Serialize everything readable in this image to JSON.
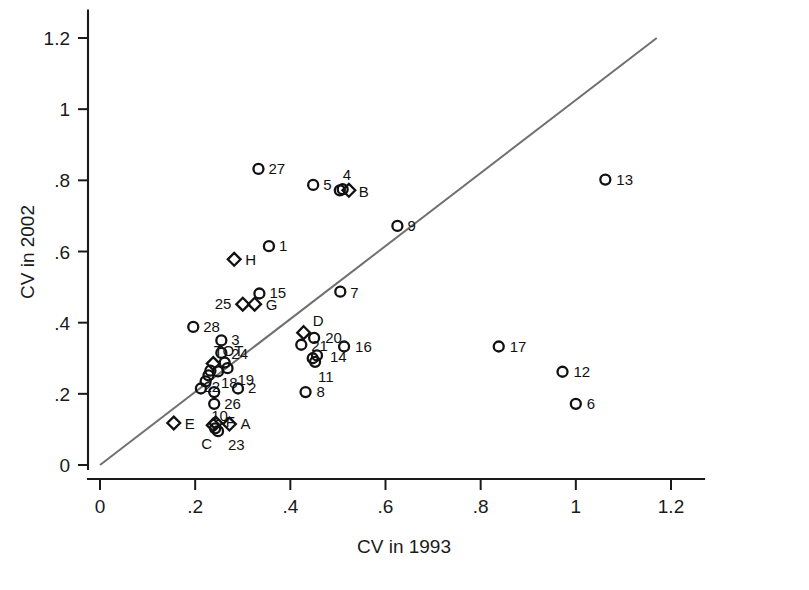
{
  "chart_data": {
    "type": "scatter",
    "title": "",
    "xlabel": "CV in 1993",
    "ylabel": "CV in 2002",
    "xlim": [
      0,
      1.24
    ],
    "ylim": [
      0,
      1.26
    ],
    "xticks": [
      "0",
      ".2",
      ".4",
      ".6",
      ".8",
      "1",
      "1.2"
    ],
    "xtick_values": [
      0,
      0.2,
      0.4,
      0.6,
      0.8,
      1.0,
      1.2
    ],
    "yticks": [
      "0",
      ".2",
      ".4",
      ".6",
      ".8",
      "1",
      "1.2"
    ],
    "ytick_values": [
      0,
      0.2,
      0.4,
      0.6,
      0.8,
      1.0,
      1.2
    ],
    "grid": false,
    "legend": "none",
    "reference_line": {
      "name": "identity-line",
      "from": [
        0.0,
        0.0
      ],
      "to": [
        1.17,
        1.2
      ],
      "color": "#70706e"
    },
    "points": [
      {
        "label": "1",
        "marker": "circle",
        "x": 0.355,
        "y": 0.615,
        "lx": 10,
        "ly": 5
      },
      {
        "label": "2",
        "marker": "circle",
        "x": 0.29,
        "y": 0.215,
        "lx": 10,
        "ly": 5
      },
      {
        "label": "3",
        "marker": "circle",
        "x": 0.255,
        "y": 0.35,
        "lx": 10,
        "ly": 5
      },
      {
        "label": "4",
        "marker": "circle",
        "x": 0.51,
        "y": 0.775,
        "lx": 0,
        "ly": -9
      },
      {
        "label": "5",
        "marker": "circle",
        "x": 0.448,
        "y": 0.787,
        "lx": 10,
        "ly": 5
      },
      {
        "label": "6",
        "marker": "circle",
        "x": 1.0,
        "y": 0.172,
        "lx": 11,
        "ly": 5
      },
      {
        "label": "7",
        "marker": "circle",
        "x": 0.505,
        "y": 0.487,
        "lx": 10,
        "ly": 6
      },
      {
        "label": "8",
        "marker": "circle",
        "x": 0.432,
        "y": 0.205,
        "lx": 11,
        "ly": 5
      },
      {
        "label": "9",
        "marker": "circle",
        "x": 0.625,
        "y": 0.672,
        "lx": 10,
        "ly": 5
      },
      {
        "label": "10",
        "marker": "circle",
        "x": 0.24,
        "y": 0.172,
        "lx": -3,
        "ly": 17
      },
      {
        "label": "11",
        "marker": "circle",
        "x": 0.452,
        "y": 0.29,
        "lx": 3,
        "ly": 20
      },
      {
        "label": "12",
        "marker": "circle",
        "x": 0.972,
        "y": 0.262,
        "lx": 11,
        "ly": 5
      },
      {
        "label": "13",
        "marker": "circle",
        "x": 1.062,
        "y": 0.802,
        "lx": 11,
        "ly": 5
      },
      {
        "label": "14",
        "marker": "circle",
        "x": 0.456,
        "y": 0.308,
        "lx": 13,
        "ly": 7
      },
      {
        "label": "15",
        "marker": "circle",
        "x": 0.335,
        "y": 0.482,
        "lx": 10,
        "ly": 5
      },
      {
        "label": "16",
        "marker": "circle",
        "x": 0.513,
        "y": 0.333,
        "lx": 11,
        "ly": 5
      },
      {
        "label": "17",
        "marker": "circle",
        "x": 0.838,
        "y": 0.333,
        "lx": 11,
        "ly": 5
      },
      {
        "label": "18",
        "marker": "circle",
        "x": 0.248,
        "y": 0.263,
        "lx": 3,
        "ly": 17
      },
      {
        "label": "19",
        "marker": "circle",
        "x": 0.268,
        "y": 0.272,
        "lx": 10,
        "ly": 17
      },
      {
        "label": "20",
        "marker": "circle",
        "x": 0.45,
        "y": 0.357,
        "lx": 11,
        "ly": 5
      },
      {
        "label": "21",
        "marker": "circle",
        "x": 0.423,
        "y": 0.338,
        "lx": 10,
        "ly": 6
      },
      {
        "label": "22",
        "marker": "circle",
        "x": 0.228,
        "y": 0.252,
        "lx": -5,
        "ly": 17
      },
      {
        "label": "23",
        "marker": "circle",
        "x": 0.248,
        "y": 0.095,
        "lx": 10,
        "ly": 19
      },
      {
        "label": "24",
        "marker": "circle",
        "x": 0.255,
        "y": 0.315,
        "lx": 10,
        "ly": 6
      },
      {
        "label": "25",
        "marker": "diamond",
        "x": 0.3,
        "y": 0.452,
        "lx": -28,
        "ly": 5
      },
      {
        "label": "26",
        "marker": "circle",
        "x": 0.24,
        "y": 0.205,
        "lx": 10,
        "ly": 17
      },
      {
        "label": "27",
        "marker": "circle",
        "x": 0.333,
        "y": 0.832,
        "lx": 10,
        "ly": 5
      },
      {
        "label": "28",
        "marker": "circle",
        "x": 0.196,
        "y": 0.388,
        "lx": 10,
        "ly": 5
      },
      {
        "label": "TOT",
        "marker": "circle",
        "x": 0.262,
        "y": 0.288,
        "lx": -11,
        "ly": -7
      },
      {
        "label": "A",
        "marker": "diamond",
        "x": 0.272,
        "y": 0.115,
        "lx": 11,
        "ly": 5
      },
      {
        "label": "B",
        "marker": "diamond",
        "x": 0.523,
        "y": 0.772,
        "lx": 10,
        "ly": 7
      },
      {
        "label": "C",
        "marker": "circle",
        "x": 0.242,
        "y": 0.103,
        "lx": -14,
        "ly": 21
      },
      {
        "label": "D",
        "marker": "diamond",
        "x": 0.428,
        "y": 0.372,
        "lx": 9,
        "ly": -7
      },
      {
        "label": "E",
        "marker": "diamond",
        "x": 0.155,
        "y": 0.118,
        "lx": 11,
        "ly": 6
      },
      {
        "label": "F",
        "marker": "diamond",
        "x": 0.243,
        "y": 0.118,
        "lx": 10,
        "ly": 4
      },
      {
        "label": "G",
        "marker": "diamond",
        "x": 0.325,
        "y": 0.452,
        "lx": 11,
        "ly": 6
      },
      {
        "label": "H",
        "marker": "diamond",
        "x": 0.282,
        "y": 0.578,
        "lx": 11,
        "ly": 6
      },
      {
        "label": "",
        "marker": "diamond",
        "x": 0.238,
        "y": 0.285,
        "lx": 0,
        "ly": 0
      },
      {
        "label": "",
        "marker": "diamond",
        "x": 0.238,
        "y": 0.112,
        "lx": 0,
        "ly": 0
      },
      {
        "label": "",
        "marker": "circle",
        "x": 0.222,
        "y": 0.235,
        "lx": 0,
        "ly": 0
      },
      {
        "label": "",
        "marker": "circle",
        "x": 0.212,
        "y": 0.215,
        "lx": 0,
        "ly": 0
      },
      {
        "label": "",
        "marker": "circle",
        "x": 0.232,
        "y": 0.265,
        "lx": 0,
        "ly": 0
      },
      {
        "label": "",
        "marker": "circle",
        "x": 0.447,
        "y": 0.3,
        "lx": 0,
        "ly": 0
      },
      {
        "label": "",
        "marker": "circle",
        "x": 0.504,
        "y": 0.772,
        "lx": 0,
        "ly": 0
      }
    ]
  },
  "colors": {
    "axis": "#1a1a1a",
    "marker": "#111111",
    "reference_line": "#70706e",
    "background": "#ffffff"
  }
}
